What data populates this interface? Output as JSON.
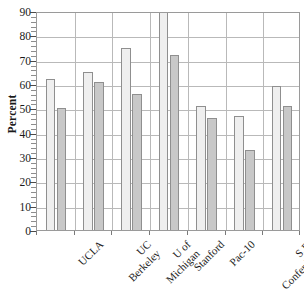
{
  "chart_data": {
    "type": "bar",
    "title": "",
    "xlabel": "",
    "ylabel": "Percent",
    "ylim": [
      0,
      90
    ],
    "ytick_step": 10,
    "yticks": [
      0,
      10,
      20,
      30,
      40,
      50,
      60,
      70,
      80,
      90
    ],
    "grid": true,
    "legend": null,
    "legend_position": "none",
    "orientation": "vertical",
    "grouped": true,
    "categories": [
      "UCLA",
      "UC Berkeley",
      "U of Michigan",
      "Stanford",
      "Pac-10",
      "S.E. Conference",
      "Big 10"
    ],
    "category_lines": [
      [
        "UCLA"
      ],
      [
        "UC",
        "Berkeley"
      ],
      [
        "U of",
        "Michigan"
      ],
      [
        "Stanford"
      ],
      [
        "Pac-10"
      ],
      [
        "S.E.",
        "Conference"
      ],
      [
        "Big 10"
      ]
    ],
    "series": [
      {
        "name": "series-a",
        "color": "#efefef",
        "values": [
          62,
          65,
          75,
          90,
          51,
          47,
          59
        ]
      },
      {
        "name": "series-b",
        "color": "#c8c8c8",
        "values": [
          50,
          61,
          56,
          72,
          46,
          33,
          51
        ]
      }
    ]
  },
  "axes": {
    "y_title": "Percent",
    "y_tick_labels": [
      "90",
      "80",
      "70",
      "60",
      "50",
      "40",
      "30",
      "20",
      "10",
      "0"
    ]
  },
  "colors": {
    "series_a": "#efefef",
    "series_b": "#c8c8c8",
    "bar_border": "#8f8f8f",
    "gridline": "#b9b9b9",
    "frame": "#9a9a9a",
    "text": "#1a1a1a"
  }
}
